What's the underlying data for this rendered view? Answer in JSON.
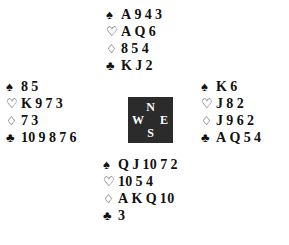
{
  "diagram": {
    "type": "bridge-deal",
    "background_color": "#ffffff",
    "text_color": "#111111"
  },
  "compass": {
    "background_color": "#2b2b2b",
    "text_color": "#ffffff",
    "north": "N",
    "west": "W",
    "east": "E",
    "south": "S"
  },
  "suits": {
    "spade_symbol": "♠",
    "heart_symbol": "♡",
    "diamond_symbol": "♢",
    "club_symbol": "♣",
    "spade_name": "spades",
    "heart_name": "hearts",
    "diamond_name": "diamonds",
    "club_name": "clubs"
  },
  "hands": {
    "north": {
      "label": "North",
      "spades": "A 9 4 3",
      "hearts": "A Q 6",
      "diamonds": "8 5 4",
      "clubs": "K J 2"
    },
    "west": {
      "label": "West",
      "spades": "8 5",
      "hearts": "K 9 7 3",
      "diamonds": "7 3",
      "clubs": "10 9 8 7 6"
    },
    "east": {
      "label": "East",
      "spades": "K 6",
      "hearts": "J 8 2",
      "diamonds": "J 9 6 2",
      "clubs": "A Q 5 4"
    },
    "south": {
      "label": "South",
      "spades": "Q J 10 7 2",
      "hearts": "10 5 4",
      "diamonds": "A K Q 10",
      "clubs": "3"
    }
  }
}
